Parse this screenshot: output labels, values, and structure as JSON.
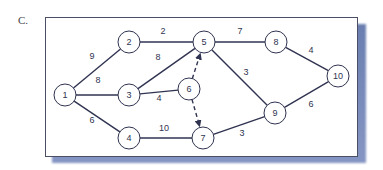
{
  "figure_label": "C.",
  "colors": {
    "edge": "#2f3350",
    "node_fill": "#ffffff",
    "shadow": "#7488bb"
  },
  "nodes": [
    {
      "id": "1",
      "x": 65,
      "y": 95
    },
    {
      "id": "2",
      "x": 129,
      "y": 42
    },
    {
      "id": "3",
      "x": 129,
      "y": 95
    },
    {
      "id": "4",
      "x": 129,
      "y": 138
    },
    {
      "id": "5",
      "x": 204,
      "y": 42
    },
    {
      "id": "6",
      "x": 189,
      "y": 89
    },
    {
      "id": "7",
      "x": 203,
      "y": 138
    },
    {
      "id": "8",
      "x": 276,
      "y": 42
    },
    {
      "id": "9",
      "x": 275,
      "y": 113
    },
    {
      "id": "10",
      "x": 338,
      "y": 76
    }
  ],
  "edges": [
    {
      "from": "1",
      "to": "2",
      "weight": "9",
      "lx": 92,
      "ly": 59
    },
    {
      "from": "1",
      "to": "3",
      "weight": "8",
      "lx": 98,
      "ly": 83
    },
    {
      "from": "1",
      "to": "4",
      "weight": "6",
      "lx": 92,
      "ly": 123
    },
    {
      "from": "2",
      "to": "5",
      "weight": "2",
      "lx": 163,
      "ly": 34
    },
    {
      "from": "3",
      "to": "5",
      "weight": "8",
      "lx": 158,
      "ly": 60
    },
    {
      "from": "3",
      "to": "6",
      "weight": "4",
      "lx": 159,
      "ly": 101
    },
    {
      "from": "4",
      "to": "7",
      "weight": "10",
      "lx": 164,
      "ly": 131
    },
    {
      "from": "5",
      "to": "8",
      "weight": "7",
      "lx": 240,
      "ly": 34
    },
    {
      "from": "5",
      "to": "9",
      "weight": "3",
      "lx": 246,
      "ly": 75
    },
    {
      "from": "8",
      "to": "10",
      "weight": "4",
      "lx": 311,
      "ly": 53
    },
    {
      "from": "9",
      "to": "10",
      "weight": "6",
      "lx": 311,
      "ly": 107
    },
    {
      "from": "7",
      "to": "9",
      "weight": "3",
      "lx": 242,
      "ly": 136
    },
    {
      "from": "6",
      "to": "5",
      "weight": "",
      "dummy": true
    },
    {
      "from": "6",
      "to": "7",
      "weight": "",
      "dummy": true
    }
  ]
}
